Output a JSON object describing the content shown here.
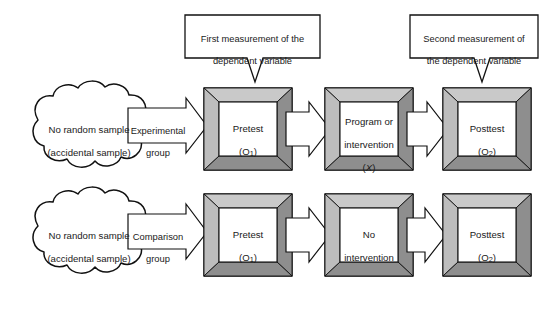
{
  "diagram": {
    "colors": {
      "page_background": "#ffffff",
      "outline": "#111111",
      "frame_light": "#c9c9c9",
      "frame_mid": "#b4b4b4",
      "frame_dark": "#8e8e8e",
      "frame_darkest": "#7b7b7b",
      "box_interior": "#ffffff",
      "arrow_fill": "#ffffff",
      "cloud_fill": "#ffffff",
      "callout_fill": "#ffffff"
    }
  },
  "callouts": [
    {
      "id": "first-measurement",
      "line1": "First measurement of the",
      "line2": "dependent variable",
      "points_to": "top-row-pretest"
    },
    {
      "id": "second-measurement",
      "line1": "Second measurement of",
      "line2": "the dependent variable",
      "points_to": "top-row-posttest"
    }
  ],
  "rows": [
    {
      "id": "experimental-row",
      "cloud": {
        "line1": "No random sample",
        "line2": "(accidental sample)"
      },
      "group_arrow": {
        "line1": "Experimental",
        "line2": "group"
      },
      "stages": [
        {
          "id": "pretest",
          "line1": "Pretest",
          "line2": "(O",
          "sub": "1",
          "line2_end": ")"
        },
        {
          "id": "intervention",
          "line1": "Program or",
          "line2": "intervention",
          "line3": "(X)",
          "italic_symbol": "X"
        },
        {
          "id": "posttest",
          "line1": "Posttest",
          "line2": "(O",
          "sub": "2",
          "line2_end": ")"
        }
      ]
    },
    {
      "id": "comparison-row",
      "cloud": {
        "line1": "No random sample",
        "line2": "(accidental sample)"
      },
      "group_arrow": {
        "line1": "Comparison",
        "line2": "group"
      },
      "stages": [
        {
          "id": "pretest",
          "line1": "Pretest",
          "line2": "(O",
          "sub": "1",
          "line2_end": ")"
        },
        {
          "id": "no-intervention",
          "line1": "No",
          "line2": "intervention"
        },
        {
          "id": "posttest",
          "line1": "Posttest",
          "line2": "(O",
          "sub": "2",
          "line2_end": ")"
        }
      ]
    }
  ]
}
